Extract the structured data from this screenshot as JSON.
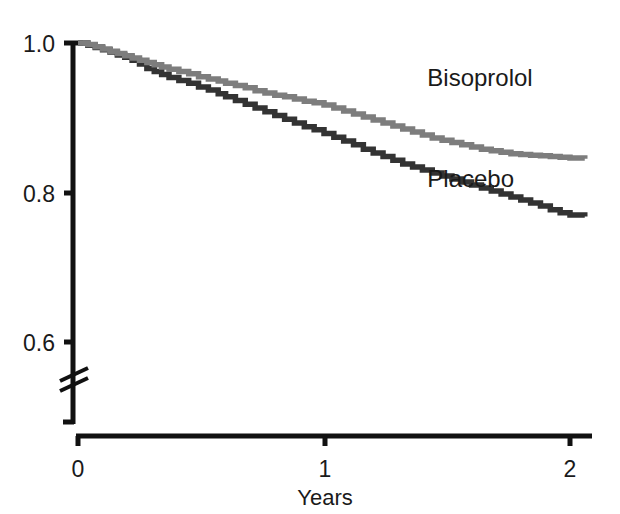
{
  "chart_data": {
    "type": "line",
    "subtype": "kaplan-meier-step",
    "title": "",
    "xlabel": "Years",
    "ylabel": "",
    "xlim": [
      0,
      2.1
    ],
    "ylim": [
      0.56,
      1.005
    ],
    "y_axis_break": true,
    "y_axis_break_below": 0.6,
    "grid": false,
    "legend_position": "inline-annotations",
    "x_ticks": [
      "0",
      "1",
      "2"
    ],
    "x_tick_values": [
      0,
      1,
      2
    ],
    "y_ticks": [
      "1.0",
      "0.8",
      "0.6"
    ],
    "y_tick_values": [
      1.0,
      0.8,
      0.6
    ],
    "series": [
      {
        "name": "Bisoprolol",
        "color": "#7d7d7d",
        "label_x": 1.42,
        "label_y": 0.943,
        "final_value": 0.845,
        "x": [
          0.0,
          0.04,
          0.07,
          0.1,
          0.13,
          0.16,
          0.19,
          0.22,
          0.25,
          0.28,
          0.31,
          0.34,
          0.37,
          0.41,
          0.45,
          0.49,
          0.53,
          0.57,
          0.6,
          0.64,
          0.68,
          0.72,
          0.76,
          0.8,
          0.84,
          0.88,
          0.92,
          0.96,
          1.0,
          1.04,
          1.08,
          1.12,
          1.16,
          1.2,
          1.24,
          1.28,
          1.32,
          1.36,
          1.4,
          1.44,
          1.48,
          1.52,
          1.56,
          1.6,
          1.64,
          1.68,
          1.72,
          1.76,
          1.8,
          1.84,
          1.88,
          1.92,
          1.96,
          2.0,
          2.06
        ],
        "y": [
          1.0,
          0.998,
          0.995,
          0.992,
          0.989,
          0.986,
          0.983,
          0.98,
          0.977,
          0.974,
          0.971,
          0.968,
          0.965,
          0.962,
          0.959,
          0.955,
          0.952,
          0.949,
          0.946,
          0.943,
          0.94,
          0.936,
          0.933,
          0.93,
          0.928,
          0.925,
          0.922,
          0.92,
          0.917,
          0.913,
          0.909,
          0.905,
          0.901,
          0.897,
          0.893,
          0.889,
          0.885,
          0.881,
          0.877,
          0.873,
          0.87,
          0.867,
          0.864,
          0.861,
          0.858,
          0.856,
          0.854,
          0.852,
          0.851,
          0.85,
          0.849,
          0.848,
          0.847,
          0.846,
          0.845
        ]
      },
      {
        "name": "Placebo",
        "color": "#333333",
        "label_x": 1.42,
        "label_y": 0.808,
        "final_value": 0.768,
        "x": [
          0.0,
          0.04,
          0.07,
          0.1,
          0.13,
          0.16,
          0.19,
          0.22,
          0.25,
          0.28,
          0.31,
          0.34,
          0.37,
          0.41,
          0.45,
          0.49,
          0.53,
          0.57,
          0.6,
          0.64,
          0.68,
          0.72,
          0.76,
          0.8,
          0.84,
          0.88,
          0.92,
          0.96,
          1.0,
          1.04,
          1.08,
          1.12,
          1.16,
          1.2,
          1.24,
          1.28,
          1.32,
          1.36,
          1.4,
          1.44,
          1.48,
          1.52,
          1.56,
          1.6,
          1.64,
          1.68,
          1.72,
          1.76,
          1.8,
          1.84,
          1.88,
          1.92,
          1.96,
          2.0,
          2.06
        ],
        "y": [
          1.0,
          0.997,
          0.994,
          0.991,
          0.988,
          0.984,
          0.981,
          0.977,
          0.972,
          0.966,
          0.962,
          0.958,
          0.954,
          0.95,
          0.946,
          0.941,
          0.937,
          0.932,
          0.928,
          0.923,
          0.918,
          0.913,
          0.908,
          0.903,
          0.898,
          0.893,
          0.888,
          0.884,
          0.879,
          0.874,
          0.869,
          0.864,
          0.858,
          0.853,
          0.848,
          0.843,
          0.838,
          0.834,
          0.83,
          0.826,
          0.822,
          0.818,
          0.814,
          0.81,
          0.806,
          0.802,
          0.798,
          0.794,
          0.79,
          0.786,
          0.782,
          0.777,
          0.773,
          0.77,
          0.768
        ]
      }
    ]
  },
  "axes": {
    "x_title": "Years",
    "x_tick_0": "0",
    "x_tick_1": "1",
    "x_tick_2": "2",
    "y_tick_10": "1.0",
    "y_tick_08": "0.8",
    "y_tick_06": "0.6"
  },
  "labels": {
    "bisoprolol": "Bisoprolol",
    "placebo": "Placebo"
  },
  "colors": {
    "bisoprolol": "#7d7d7d",
    "placebo": "#333333",
    "axis": "#111111",
    "text": "#1a1a1a",
    "background": "#ffffff"
  }
}
